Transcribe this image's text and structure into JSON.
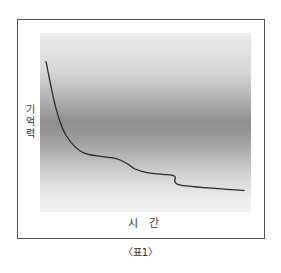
{
  "chart_data": {
    "type": "line",
    "title": "",
    "caption": "〈표1〉",
    "xlabel": "시 간",
    "ylabel": "기억력",
    "ylabel_chars": [
      "기",
      "억",
      "력"
    ],
    "grid": false,
    "legend": null,
    "axis_ticks": false,
    "series": [
      {
        "name": "기억력",
        "x": [
          0,
          5,
          10,
          19,
          35,
          41,
          45,
          51,
          59,
          65,
          68,
          100
        ],
        "y": [
          84,
          58,
          43,
          33,
          30,
          27,
          24,
          22,
          21,
          20,
          15,
          12
        ]
      }
    ],
    "xlim": [
      0,
      100
    ],
    "ylim": [
      0,
      100
    ],
    "style": {
      "line_color": "#2a2a2a",
      "background": "vertical gray gradient, darkest at middle"
    }
  },
  "labels": {
    "y_axis": [
      "기",
      "억",
      "력"
    ],
    "x_axis": "시 간",
    "caption": "〈표1〉"
  }
}
